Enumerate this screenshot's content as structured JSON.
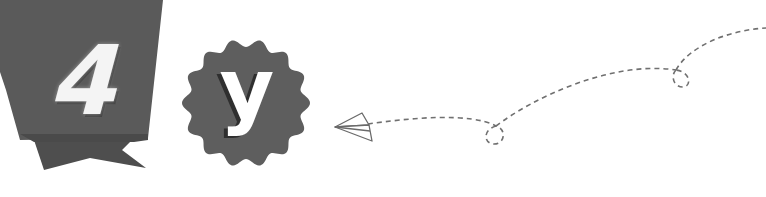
{
  "banner": {
    "number": "4",
    "color": "#595959",
    "shadow_color": "#4a4a4a"
  },
  "badge": {
    "letter": "y",
    "color": "#5e5e5e"
  },
  "trail": {
    "icon": "paper-airplane-icon",
    "stroke_color": "#707070",
    "style": "dashed"
  }
}
